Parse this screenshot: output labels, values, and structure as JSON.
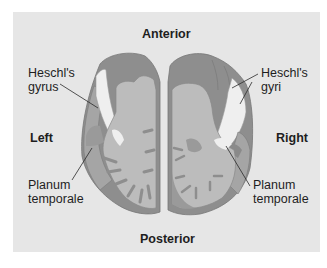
{
  "diagram": {
    "orientation": {
      "top": "Anterior",
      "bottom": "Posterior",
      "left": "Left",
      "right": "Right"
    },
    "labels": {
      "left_heschl_line1": "Heschl's",
      "left_heschl_line2": "gyrus",
      "right_heschl_line1": "Heschl's",
      "right_heschl_line2": "gyri",
      "left_planum_line1": "Planum",
      "left_planum_line2": "temporale",
      "right_planum_line1": "Planum",
      "right_planum_line2": "temporale"
    },
    "colors": {
      "panel": "#e6e6e6",
      "cortex_dark": "#8e8e8e",
      "tissue_mid": "#a9a9a9",
      "white_matter": "#bcbcbc",
      "heschl_region": "#efefef",
      "text": "#1e1e1e"
    }
  }
}
